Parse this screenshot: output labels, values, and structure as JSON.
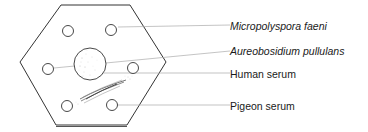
{
  "diagram": {
    "type": "immunodiffusion-plate",
    "shape": "hexagon",
    "wells": [
      {
        "position": "top-left"
      },
      {
        "position": "top-right"
      },
      {
        "position": "left"
      },
      {
        "position": "center"
      },
      {
        "position": "right"
      },
      {
        "position": "bottom-left"
      },
      {
        "position": "bottom-right"
      }
    ],
    "precipitin_band": "between center well and bottom-left/bottom-right wells"
  },
  "labels": [
    {
      "text": "Micropolyspora faeni",
      "italic": true,
      "points_to": "top-right well"
    },
    {
      "text": "Aureobosidium pullulans",
      "italic": true,
      "points_to": "left well"
    },
    {
      "text": "Human serum",
      "italic": false,
      "points_to": "center well"
    },
    {
      "text": "Pigeon serum",
      "italic": false,
      "points_to": "bottom-right well"
    }
  ],
  "colors": {
    "outline": "#333333",
    "leader_line": "#999999",
    "text": "#1a1a1a"
  }
}
